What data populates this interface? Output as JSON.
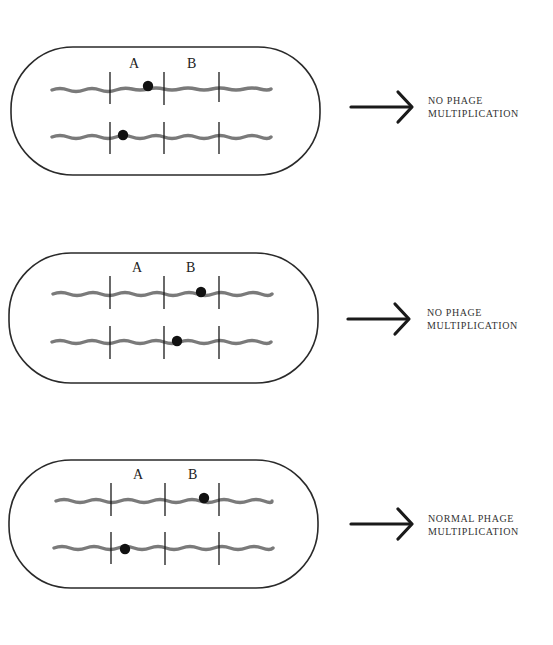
{
  "panels": [
    {
      "gene_a_label": "A",
      "gene_b_label": "B",
      "chromosome_1_mutation": "A",
      "chromosome_2_mutation": "A",
      "outcome_line1": "NO PHAGE",
      "outcome_line2": "MULTIPLICATION"
    },
    {
      "gene_a_label": "A",
      "gene_b_label": "B",
      "chromosome_1_mutation": "B",
      "chromosome_2_mutation": "B",
      "outcome_line1": "NO PHAGE",
      "outcome_line2": "MULTIPLICATION"
    },
    {
      "gene_a_label": "A",
      "gene_b_label": "B",
      "chromosome_1_mutation": "B",
      "chromosome_2_mutation": "A",
      "outcome_line1": "NORMAL PHAGE",
      "outcome_line2": "MULTIPLICATION"
    }
  ],
  "colors": {
    "cell_outline": "#2a2a2a",
    "chromosome": "#7a7a7a",
    "mutation_dot": "#111111",
    "arrow": "#1a1a1a"
  }
}
